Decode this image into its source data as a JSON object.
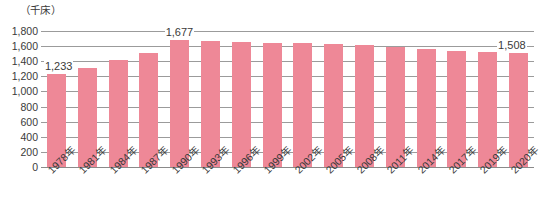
{
  "chart_data": {
    "type": "bar",
    "title": "",
    "unit_caption": "（千床）",
    "xlabel": "",
    "ylabel": "",
    "ylim": [
      0,
      1800
    ],
    "ytick_step": 200,
    "grid": true,
    "legend": "none",
    "bar_color": "#ee8897",
    "axis_color": "#8a8a8a",
    "text_color": "#3a3a3a",
    "categories": [
      "1978年",
      "1981年",
      "1984年",
      "1987年",
      "1990年",
      "1993年",
      "1996年",
      "1999年",
      "2002年",
      "2005年",
      "2008年",
      "2011年",
      "2014年",
      "2017年",
      "2019年",
      "2020年"
    ],
    "values": [
      1233,
      1310,
      1410,
      1512,
      1677,
      1668,
      1652,
      1647,
      1643,
      1631,
      1610,
      1583,
      1568,
      1529,
      1520,
      1508
    ],
    "ytick_labels": [
      "1,800",
      "1,600",
      "1,400",
      "1,200",
      "1,000",
      "800",
      "600",
      "400",
      "200",
      "0"
    ],
    "ytick_values": [
      1800,
      1600,
      1400,
      1200,
      1000,
      800,
      600,
      400,
      200,
      0
    ],
    "annotations": [
      {
        "label": "1,233",
        "category": "1978年",
        "value": 1233
      },
      {
        "label": "1,677",
        "category": "1990年",
        "value": 1677
      },
      {
        "label": "1,508",
        "category": "2020年",
        "value": 1508
      }
    ]
  }
}
